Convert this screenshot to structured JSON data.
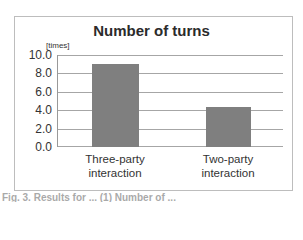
{
  "chart_data": {
    "type": "bar",
    "title": "Number of turns",
    "ylabel": "[times]",
    "xlabel": "",
    "categories": [
      "Three-party interaction",
      "Two-party interaction"
    ],
    "category_lines": [
      [
        "Three-party",
        "interaction"
      ],
      [
        "Two-party",
        "interaction"
      ]
    ],
    "values": [
      9.0,
      4.4
    ],
    "ylim": [
      0,
      10
    ],
    "yticks": [
      "0.0",
      "2.0",
      "4.0",
      "6.0",
      "8.0",
      "10.0"
    ],
    "grid": true,
    "legend": null,
    "bar_color": "#7f7f7f"
  },
  "caption": "Fig. 3. Results for ... (1) Number of ..."
}
